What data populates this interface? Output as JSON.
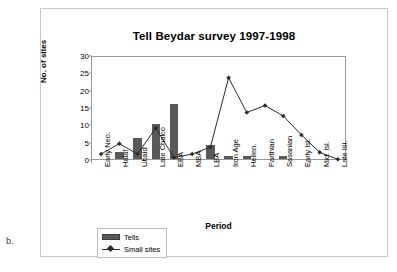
{
  "figure": {
    "panel_label": "b."
  },
  "chart_data": {
    "type": "bar",
    "title": "Tell Beydar survey 1997-1998",
    "xlabel": "Period",
    "ylabel": "No. of sites",
    "ylim": [
      0,
      30
    ],
    "yticks": [
      0,
      5,
      10,
      15,
      20,
      25,
      30
    ],
    "grid": false,
    "legend_position": "bottom-left",
    "categories": [
      "Early Neo.",
      "Halaf",
      "Ubaid",
      "Late Chalco",
      "EBA",
      "MBA",
      "LBA",
      "Iron Age",
      "Hellen.",
      "Parthian",
      "Sasanian",
      "Early Isl.",
      "Mid. Isl.",
      "Late Isl."
    ],
    "series": [
      {
        "name": "Tells",
        "type": "bar",
        "color": "#595959",
        "values": [
          0,
          2,
          6,
          10,
          16,
          0,
          4,
          1,
          1,
          0,
          1,
          0,
          0,
          0
        ]
      },
      {
        "name": "Small sites",
        "type": "line",
        "color": "#2b2b2b",
        "marker": "diamond",
        "values": [
          2,
          5,
          2,
          9.5,
          1,
          2,
          4,
          24,
          14,
          16,
          13,
          7.5,
          2.5,
          0.5
        ]
      }
    ]
  }
}
